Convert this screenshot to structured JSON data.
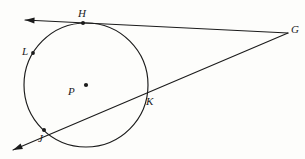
{
  "figure": {
    "background_color": "#fdfdfb",
    "ink_color": "#1b1b1b",
    "stroke_width": 1.1
  },
  "circle": {
    "name": "circle-P",
    "center_label": "P",
    "center": {
      "x": 86,
      "y": 85
    },
    "radius": 62,
    "center_dot_radius": 2.1
  },
  "points": [
    {
      "id": "H",
      "label": "H",
      "x": 83,
      "y": 23,
      "role": "tangent-point",
      "dot": true,
      "dot_radius": 2.0,
      "label_x": 78,
      "label_y": 8
    },
    {
      "id": "G",
      "label": "G",
      "x": 288,
      "y": 33,
      "role": "external-vertex",
      "dot": false,
      "dot_radius": 0,
      "label_x": 291,
      "label_y": 24
    },
    {
      "id": "L",
      "label": "L",
      "x": 33,
      "y": 53,
      "role": "circle-point",
      "dot": true,
      "dot_radius": 1.9,
      "label_x": 22,
      "label_y": 46
    },
    {
      "id": "P",
      "label": "P",
      "x": 86,
      "y": 85,
      "role": "center",
      "dot": true,
      "dot_radius": 2.1,
      "label_x": 68,
      "label_y": 86
    },
    {
      "id": "K",
      "label": "K",
      "x": 144,
      "y": 93,
      "role": "secant-intersection-near",
      "dot": false,
      "dot_radius": 0,
      "label_x": 146,
      "label_y": 96
    },
    {
      "id": "J",
      "label": "J",
      "x": 44,
      "y": 130,
      "role": "secant-intersection-far",
      "dot": true,
      "dot_radius": 2.0,
      "label_x": 38,
      "label_y": 133
    }
  ],
  "lines": [
    {
      "id": "tangent-line",
      "name": "tangent-line-through-H",
      "from": {
        "x": 288,
        "y": 33
      },
      "to": {
        "x": 25,
        "y": 20
      },
      "arrow_at_to": true,
      "arrow_at_from": false,
      "through": [
        "G",
        "H"
      ]
    },
    {
      "id": "secant-line",
      "name": "secant-line-through-K-and-J",
      "from": {
        "x": 288,
        "y": 33
      },
      "to": {
        "x": 13,
        "y": 150
      },
      "arrow_at_to": true,
      "arrow_at_from": false,
      "through": [
        "G",
        "K",
        "J"
      ]
    }
  ],
  "arrowheads": [
    {
      "id": "tangent-arrow",
      "name": "tangent-line-arrowhead",
      "x": 25,
      "y": 20,
      "angle_deg": 182
    },
    {
      "id": "secant-arrow",
      "name": "secant-line-arrowhead",
      "x": 13,
      "y": 150,
      "angle_deg": 157
    }
  ]
}
